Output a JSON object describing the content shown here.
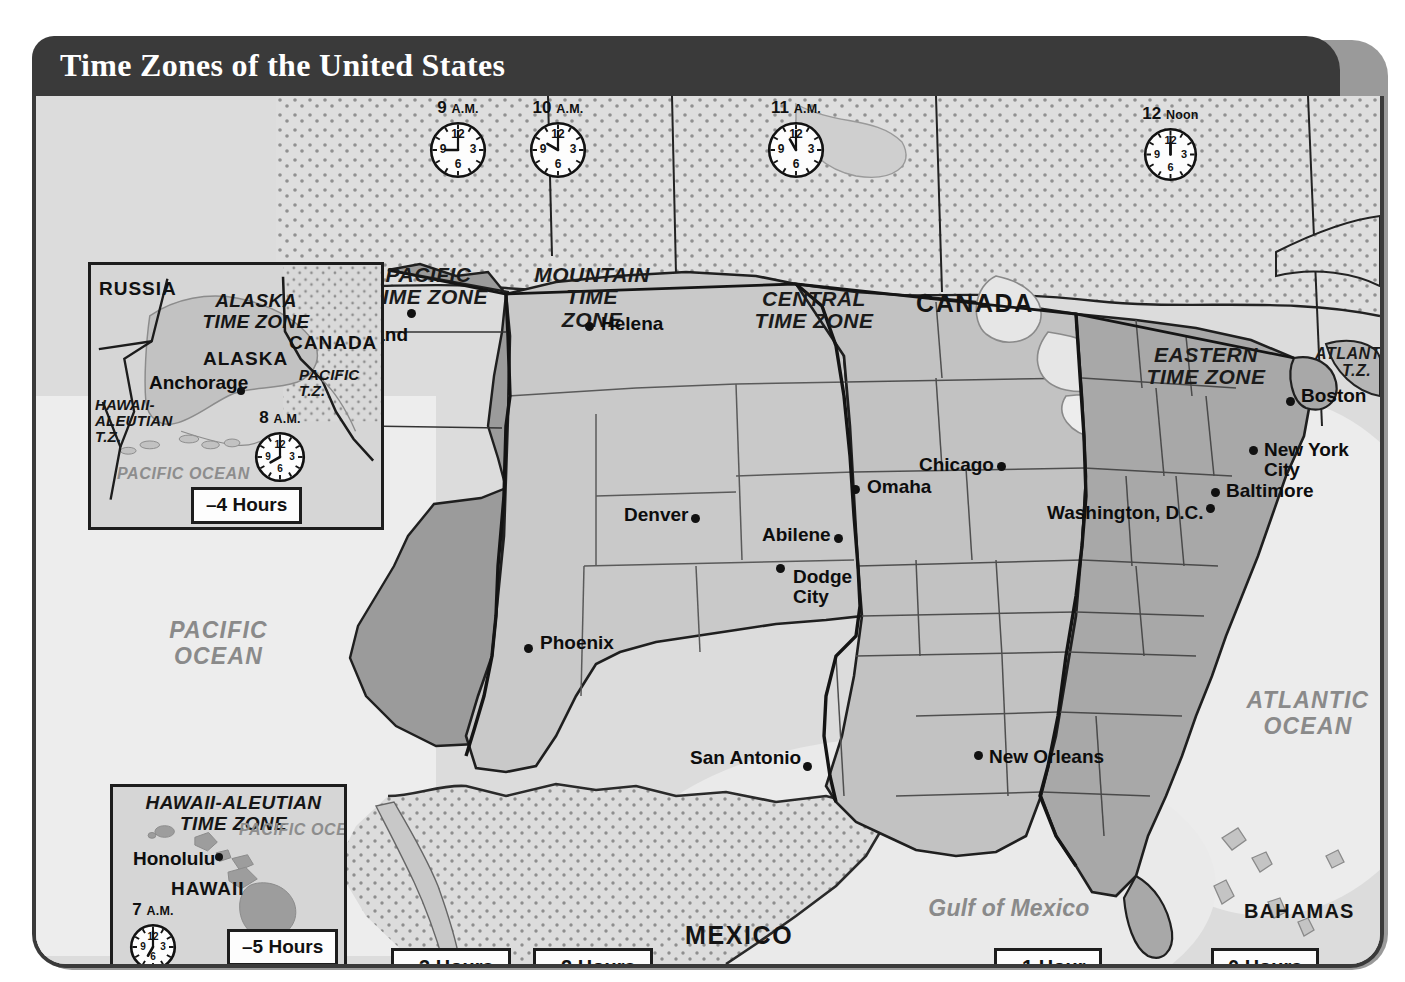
{
  "map": {
    "title": "Time Zones of the United States",
    "colors": {
      "header_bar": "#3a3a3a",
      "frame_border": "#1d1d1d",
      "ocean": "#dddddd",
      "land_light": "#d2d2d2",
      "zone_dark": "#9a9a9a",
      "zone_mid": "#b9b9b9",
      "ocean_label": "#8a8a8a",
      "text": "#111111"
    },
    "zone_labels": [
      {
        "name": "pacific-time-zone",
        "lines": [
          "PACIFIC",
          "TIME ZONE"
        ],
        "x": 392,
        "y": 183
      },
      {
        "name": "mountain-time-zone",
        "lines": [
          "MOUNTAIN",
          "TIME",
          "ZONE"
        ],
        "x": 553,
        "y": 183
      },
      {
        "name": "central-time-zone",
        "lines": [
          "CENTRAL",
          "TIME ZONE"
        ],
        "x": 777,
        "y": 207
      },
      {
        "name": "eastern-time-zone",
        "lines": [
          "EASTERN",
          "TIME ZONE"
        ],
        "x": 1170,
        "y": 257
      },
      {
        "name": "atlantic-time-zone",
        "lines": [
          "ATLANTIC",
          "T.Z."
        ],
        "x": 1310,
        "y": 258,
        "small": true
      }
    ],
    "clocks": [
      {
        "name": "clock-pacific",
        "time": "9",
        "suffix": "A.M.",
        "hour": 9,
        "minute": 0,
        "x": 425,
        "y": 121,
        "size": 58
      },
      {
        "name": "clock-mountain",
        "time": "10",
        "suffix": "A.M.",
        "hour": 10,
        "minute": 0,
        "x": 525,
        "y": 121,
        "size": 58
      },
      {
        "name": "clock-central",
        "time": "11",
        "suffix": "A.M.",
        "hour": 11,
        "minute": 0,
        "x": 763,
        "y": 121,
        "size": 58
      },
      {
        "name": "clock-eastern",
        "time": "12",
        "suffix": "Noon",
        "hour": 12,
        "minute": 0,
        "x": 1139,
        "y": 127,
        "size": 55
      }
    ],
    "countries": [
      {
        "name": "country-canada",
        "label": "CANADA",
        "x": 880,
        "y": 194
      },
      {
        "name": "country-mexico",
        "label": "MEXICO",
        "x": 649,
        "y": 826
      },
      {
        "name": "country-bahamas",
        "label": "BAHAMAS",
        "x": 1208,
        "y": 805,
        "small": true
      },
      {
        "name": "country-cuba",
        "label": "CUBA",
        "x": 1209,
        "y": 895,
        "small": true
      }
    ],
    "oceans": [
      {
        "name": "ocean-pacific",
        "lines": [
          "PACIFIC",
          "OCEAN"
        ],
        "x": 170,
        "y": 532
      },
      {
        "name": "ocean-atlantic",
        "lines": [
          "ATLANTIC",
          "OCEAN"
        ],
        "x": 1192,
        "y": 602
      },
      {
        "name": "gulf-of-mexico",
        "lines": [
          "Gulf of Mexico"
        ],
        "x": 898,
        "y": 812,
        "italic_mixed": true
      }
    ],
    "cities": [
      {
        "name": "city-portland",
        "label": "Portland",
        "dot_x": 407,
        "dot_y": 313,
        "lx": 404,
        "ly": 325,
        "anchor": "right"
      },
      {
        "name": "city-helena",
        "label": "Helena",
        "dot_x": 585,
        "dot_y": 326,
        "lx": 597,
        "ly": 314,
        "anchor": "left"
      },
      {
        "name": "city-san-francisco",
        "label": "San Francisco",
        "dot_x": 355,
        "dot_y": 504,
        "lx": 348,
        "ly": 483,
        "anchor": "right"
      },
      {
        "name": "city-denver",
        "label": "Denver",
        "dot_x": 691,
        "dot_y": 518,
        "lx": 684,
        "ly": 505,
        "anchor": "right"
      },
      {
        "name": "city-phoenix",
        "label": "Phoenix",
        "dot_x": 524,
        "dot_y": 648,
        "lx": 536,
        "ly": 633,
        "anchor": "left"
      },
      {
        "name": "city-abilene",
        "label": "Abilene",
        "dot_x": 834,
        "dot_y": 538,
        "lx": 827,
        "ly": 525,
        "anchor": "right"
      },
      {
        "name": "city-dodge-city",
        "label": "Dodge\nCity",
        "dot_x": 776,
        "dot_y": 568,
        "lx": 789,
        "ly": 567,
        "anchor": "left"
      },
      {
        "name": "city-omaha",
        "label": "Omaha",
        "dot_x": 851,
        "dot_y": 489,
        "lx": 863,
        "ly": 477,
        "anchor": "left"
      },
      {
        "name": "city-chicago",
        "label": "Chicago",
        "dot_x": 997,
        "dot_y": 466,
        "lx": 990,
        "ly": 455,
        "anchor": "right"
      },
      {
        "name": "city-san-antonio",
        "label": "San Antonio",
        "dot_x": 803,
        "dot_y": 766,
        "lx": 797,
        "ly": 748,
        "anchor": "right"
      },
      {
        "name": "city-new-orleans",
        "label": "New Orleans",
        "dot_x": 974,
        "dot_y": 755,
        "lx": 985,
        "ly": 747,
        "anchor": "left"
      },
      {
        "name": "city-boston",
        "label": "Boston",
        "dot_x": 1286,
        "dot_y": 401,
        "lx": 1297,
        "ly": 386,
        "anchor": "left"
      },
      {
        "name": "city-new-york-city",
        "label": "New York\nCity",
        "dot_x": 1249,
        "dot_y": 450,
        "lx": 1260,
        "ly": 440,
        "anchor": "left"
      },
      {
        "name": "city-baltimore",
        "label": "Baltimore",
        "dot_x": 1211,
        "dot_y": 492,
        "lx": 1222,
        "ly": 481,
        "anchor": "left"
      },
      {
        "name": "city-washington-dc",
        "label": "Washington, D.C.",
        "dot_x": 1206,
        "dot_y": 508,
        "lx": 1200,
        "ly": 503,
        "anchor": "right"
      }
    ],
    "hour_boxes": [
      {
        "name": "hourbox-minus-3",
        "label": "–3 Hours",
        "x": 355,
        "y": 855
      },
      {
        "name": "hourbox-minus-2",
        "label": "–2 Hours",
        "x": 497,
        "y": 855
      },
      {
        "name": "hourbox-minus-1",
        "label": "–1 Hour",
        "x": 958,
        "y": 855
      },
      {
        "name": "hourbox-zero",
        "label": "0 Hours",
        "x": 1175,
        "y": 855
      }
    ],
    "alaska_inset": {
      "name": "alaska-inset",
      "x": 52,
      "y": 166,
      "w": 296,
      "h": 268,
      "zone_label": [
        "ALASKA",
        "TIME ZONE"
      ],
      "zone_label_x": 196,
      "zone_label_y": 196,
      "state_label": "ALASKA",
      "state_label_x": 194,
      "state_label_y": 252,
      "countries": [
        {
          "name": "alaska-inset-russia",
          "label": "RUSSIA",
          "x": 62,
          "y": 185
        },
        {
          "name": "alaska-inset-canada",
          "label": "CANADA",
          "x": 256,
          "y": 238
        }
      ],
      "zones_small": [
        {
          "name": "alaska-inset-pacific-tz",
          "lines": [
            "PACIFIC",
            "T.Z."
          ],
          "x": 267,
          "y": 270
        },
        {
          "name": "alaska-inset-hawaii-aleutian-tz",
          "lines": [
            "HAWAII-",
            "ALEUTIAN",
            "T.Z."
          ],
          "x": 58,
          "y": 303
        }
      ],
      "city": {
        "name": "alaska-inset-anchorage",
        "label": "Anchorage",
        "dot_x": 196,
        "dot_y": 295,
        "lx": 190,
        "ly": 276
      },
      "ocean": {
        "name": "alaska-inset-pacific-ocean",
        "label": "PACIFIC OCEAN",
        "x": 78,
        "y": 374
      },
      "clock": {
        "name": "alaska-inset-clock",
        "time": "8",
        "suffix": "A.M.",
        "hour": 8,
        "minute": 0,
        "x": 215,
        "y": 332,
        "size": 52
      },
      "hour_box": {
        "name": "alaska-inset-hourbox",
        "label": "–4 Hours",
        "x": 155,
        "y": 395
      }
    },
    "hawaii_inset": {
      "name": "hawaii-inset",
      "x": 74,
      "y": 688,
      "w": 237,
      "h": 185,
      "zone_label": [
        "HAWAII-ALEUTIAN",
        "TIME ZONE"
      ],
      "zone_label_x": 196,
      "zone_label_y": 697,
      "state_label": "HAWAII",
      "state_label_x": 178,
      "state_label_y": 786,
      "city": {
        "name": "hawaii-inset-honolulu",
        "label": "Honolulu",
        "dot_x": 182,
        "dot_y": 761,
        "lx": 177,
        "ly": 755
      },
      "ocean": {
        "name": "hawaii-inset-pacific-ocean",
        "label": "PACIFIC  OCEAN",
        "x": 212,
        "y": 727
      },
      "clock": {
        "name": "hawaii-inset-clock",
        "time": "7",
        "suffix": "A.M.",
        "hour": 7,
        "minute": 0,
        "x": 90,
        "y": 824,
        "size": 48
      },
      "hour_box": {
        "name": "hawaii-inset-hourbox",
        "label": "–5 Hours",
        "x": 200,
        "y": 845
      }
    }
  }
}
